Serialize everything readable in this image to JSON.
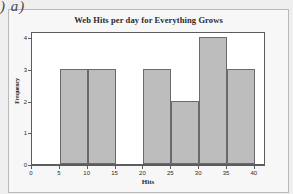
{
  "annotation": {
    "text": ") a)"
  },
  "chart_data": {
    "type": "bar",
    "title": "Web Hits per day for Everything Grows",
    "xlabel": "Hits",
    "ylabel": "Frequency",
    "xlim": [
      0,
      42
    ],
    "ylim": [
      0,
      4.2
    ],
    "grid": false,
    "legend": null,
    "bin_width": 5,
    "bins": [
      {
        "start": 5,
        "end": 10,
        "value": 3
      },
      {
        "start": 10,
        "end": 15,
        "value": 3
      },
      {
        "start": 15,
        "end": 20,
        "value": 0
      },
      {
        "start": 20,
        "end": 25,
        "value": 3
      },
      {
        "start": 25,
        "end": 30,
        "value": 2
      },
      {
        "start": 30,
        "end": 35,
        "value": 4
      },
      {
        "start": 35,
        "end": 40,
        "value": 3
      }
    ],
    "categories": [
      "5-10",
      "10-15",
      "15-20",
      "20-25",
      "25-30",
      "30-35",
      "35-40"
    ],
    "values": [
      3,
      3,
      0,
      3,
      2,
      4,
      3
    ],
    "xticks": [
      "0",
      "5",
      "10",
      "15",
      "20",
      "25",
      "30",
      "35",
      "40"
    ],
    "xtick_values": [
      0,
      5,
      10,
      15,
      20,
      25,
      30,
      35,
      40
    ],
    "yticks": [
      "0",
      "1",
      "2",
      "3",
      "4"
    ],
    "ytick_values": [
      0,
      1,
      2,
      3,
      4
    ],
    "colors": {
      "bar_fill": "#bdbdbd",
      "bar_edge": "#6a6a6a",
      "axis": "#5c5c5c",
      "plot_background": "#ffffff",
      "card_background": "#f7f7f7",
      "page_background": "#efefef",
      "text": "#2b2b2b"
    }
  }
}
